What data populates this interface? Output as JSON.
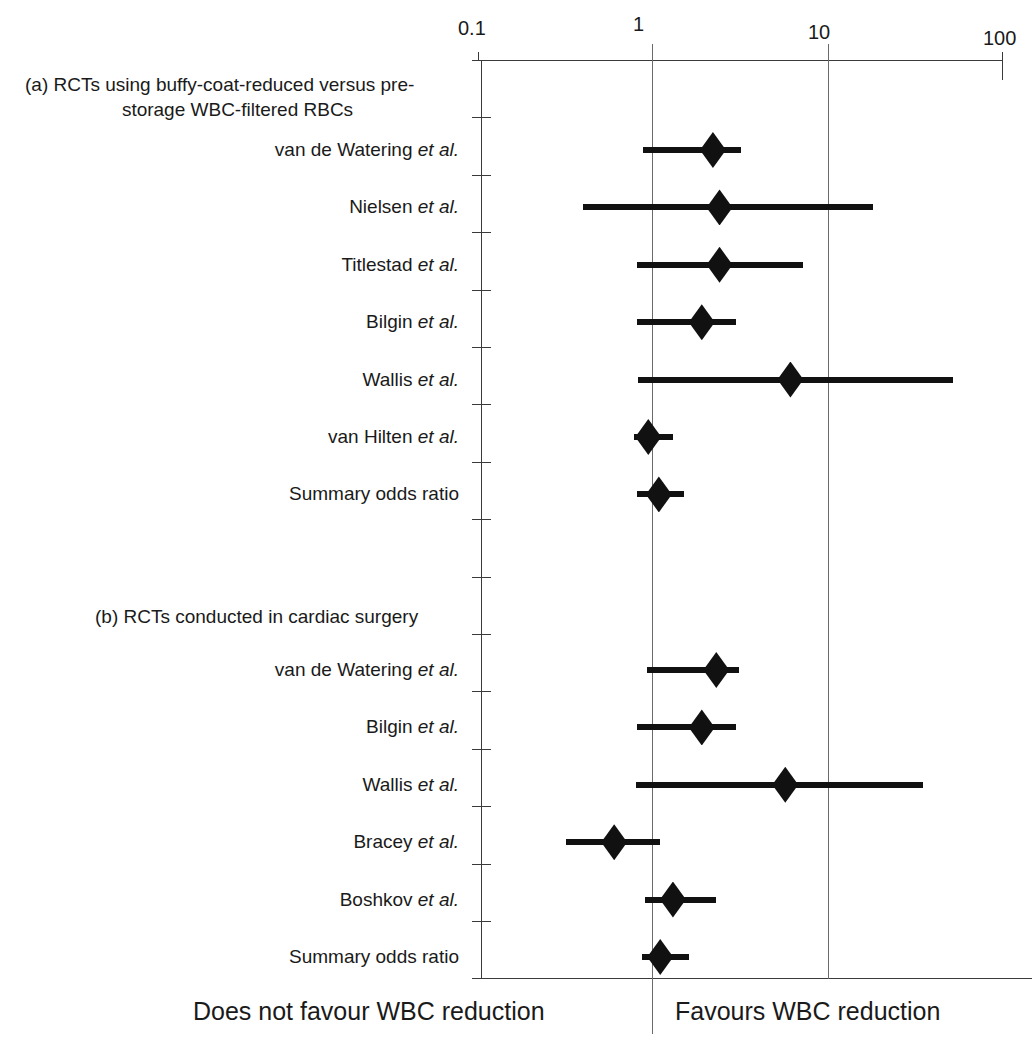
{
  "chart_data": {
    "type": "forest",
    "title": "",
    "xlabel": "Odds ratio (log scale)",
    "ylabel": "",
    "scale": "log10",
    "xlim": [
      0.1,
      100
    ],
    "grid": true,
    "gridlines_at": [
      1,
      10
    ],
    "axis_ticks": [
      {
        "value": 0.1,
        "label": "0.1"
      },
      {
        "value": 1,
        "label": "1"
      },
      {
        "value": 10,
        "label": "10"
      },
      {
        "value": 100,
        "label": "100"
      }
    ],
    "null_line": 1,
    "footer_left": "Does not favour WBC reduction",
    "footer_right": "Favours WBC reduction",
    "sections": [
      {
        "id": "a",
        "heading_line1": "(a) RCTs using buffy-coat-reduced versus pre-",
        "heading_line2": "storage WBC-filtered RBCs",
        "rows": [
          {
            "label_main": "van de Watering ",
            "label_italic": "et al.",
            "estimate": 2.2,
            "ci_low": 0.88,
            "ci_high": 3.2,
            "summary": false
          },
          {
            "label_main": "Nielsen ",
            "label_italic": "et al.",
            "estimate": 2.4,
            "ci_low": 0.4,
            "ci_high": 18.0,
            "summary": false
          },
          {
            "label_main": "Titlestad ",
            "label_italic": "et al.",
            "estimate": 2.4,
            "ci_low": 0.81,
            "ci_high": 7.2,
            "summary": false
          },
          {
            "label_main": "Bilgin ",
            "label_italic": "et al.",
            "estimate": 1.9,
            "ci_low": 0.81,
            "ci_high": 3.0,
            "summary": false
          },
          {
            "label_main": "Wallis ",
            "label_italic": "et al.",
            "estimate": 6.1,
            "ci_low": 0.82,
            "ci_high": 52.0,
            "summary": false
          },
          {
            "label_main": "van Hilten ",
            "label_italic": "et al.",
            "estimate": 0.94,
            "ci_low": 0.78,
            "ci_high": 1.3,
            "summary": false
          },
          {
            "label_main": "Summary odds ratio",
            "label_italic": "",
            "estimate": 1.08,
            "ci_low": 0.81,
            "ci_high": 1.5,
            "summary": true
          }
        ]
      },
      {
        "id": "b",
        "heading_line1": "(b) RCTs conducted in cardiac surgery",
        "heading_line2": "",
        "rows": [
          {
            "label_main": "van de Watering ",
            "label_italic": "et al.",
            "estimate": 2.3,
            "ci_low": 0.93,
            "ci_high": 3.1,
            "summary": false
          },
          {
            "label_main": "Bilgin ",
            "label_italic": "et al.",
            "estimate": 1.9,
            "ci_low": 0.81,
            "ci_high": 3.0,
            "summary": false
          },
          {
            "label_main": "Wallis ",
            "label_italic": "et al.",
            "estimate": 5.7,
            "ci_low": 0.8,
            "ci_high": 35.0,
            "summary": false
          },
          {
            "label_main": "Bracey ",
            "label_italic": "et al.",
            "estimate": 0.6,
            "ci_low": 0.32,
            "ci_high": 1.1,
            "summary": false
          },
          {
            "label_main": "Boshkov ",
            "label_italic": "et al.",
            "estimate": 1.3,
            "ci_low": 0.9,
            "ci_high": 2.3,
            "summary": false
          },
          {
            "label_main": "Summary odds ratio",
            "label_italic": "",
            "estimate": 1.1,
            "ci_low": 0.86,
            "ci_high": 1.6,
            "summary": true
          }
        ]
      }
    ]
  }
}
